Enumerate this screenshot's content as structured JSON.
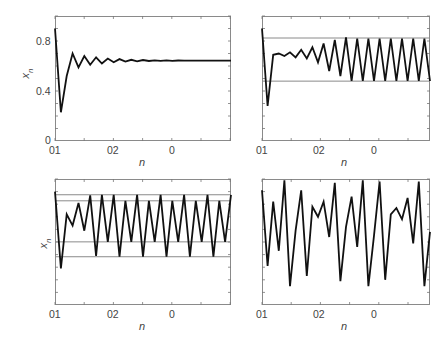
{
  "chart_data": [
    {
      "type": "line",
      "title": "",
      "panel": "top-left",
      "xlabel": "n",
      "ylabel": "x_n",
      "ylim": [
        0,
        1
      ],
      "yticks": [
        "0",
        "0.4",
        "0.8"
      ],
      "xticks": [
        "01",
        "02",
        "0"
      ],
      "grid": false,
      "reference_lines": [],
      "series": [
        {
          "name": "x_n",
          "values": [
            0.9,
            0.23,
            0.52,
            0.7,
            0.59,
            0.68,
            0.61,
            0.67,
            0.62,
            0.66,
            0.63,
            0.655,
            0.635,
            0.65,
            0.638,
            0.648,
            0.64,
            0.646,
            0.641,
            0.645,
            0.642,
            0.644,
            0.643,
            0.643,
            0.643,
            0.643,
            0.643,
            0.643,
            0.643,
            0.643,
            0.643
          ]
        }
      ]
    },
    {
      "type": "line",
      "title": "",
      "panel": "top-right",
      "xlabel": "n",
      "ylabel": "",
      "ylim": [
        0,
        1
      ],
      "xticks": [
        "01",
        "02",
        "0"
      ],
      "grid": false,
      "reference_lines": [
        0.824,
        0.479
      ],
      "series": [
        {
          "name": "x_n",
          "values": [
            0.9,
            0.28,
            0.69,
            0.7,
            0.68,
            0.71,
            0.67,
            0.73,
            0.66,
            0.75,
            0.63,
            0.78,
            0.56,
            0.81,
            0.52,
            0.83,
            0.48,
            0.82,
            0.48,
            0.82,
            0.48,
            0.82,
            0.48,
            0.82,
            0.48,
            0.82,
            0.48,
            0.82,
            0.48,
            0.82,
            0.48
          ]
        }
      ]
    },
    {
      "type": "line",
      "title": "",
      "panel": "bottom-left",
      "xlabel": "n",
      "ylabel": "x_n",
      "ylim": [
        0,
        1
      ],
      "xticks": [
        "01",
        "02",
        "0"
      ],
      "grid": false,
      "reference_lines": [
        0.875,
        0.827,
        0.501,
        0.383
      ],
      "series": [
        {
          "name": "x_n",
          "values": [
            0.9,
            0.29,
            0.72,
            0.63,
            0.81,
            0.59,
            0.87,
            0.39,
            0.875,
            0.501,
            0.875,
            0.383,
            0.827,
            0.501,
            0.875,
            0.383,
            0.827,
            0.501,
            0.875,
            0.383,
            0.827,
            0.501,
            0.875,
            0.383,
            0.827,
            0.501,
            0.875,
            0.383,
            0.827,
            0.501,
            0.875
          ]
        }
      ]
    },
    {
      "type": "line",
      "title": "",
      "panel": "bottom-right",
      "xlabel": "n",
      "ylabel": "",
      "ylim": [
        0,
        1
      ],
      "xticks": [
        "01",
        "02",
        "0"
      ],
      "grid": false,
      "reference_lines": [],
      "series": [
        {
          "name": "x_n",
          "values": [
            0.91,
            0.31,
            0.82,
            0.43,
            0.99,
            0.15,
            0.59,
            0.91,
            0.23,
            0.78,
            0.7,
            0.82,
            0.54,
            0.97,
            0.19,
            0.62,
            0.86,
            0.46,
            0.99,
            0.15,
            0.55,
            0.98,
            0.2,
            0.72,
            0.77,
            0.68,
            0.85,
            0.49,
            0.98,
            0.15,
            0.58
          ]
        }
      ]
    }
  ],
  "panels": {
    "top_left": {
      "xlabel": "n",
      "ylabel_main": "x",
      "ylabel_sub": "n",
      "yticks": [
        "0.8",
        "0.4",
        "0"
      ],
      "xticks": [
        "01",
        "02",
        "0"
      ]
    },
    "top_right": {
      "xlabel": "n",
      "xticks": [
        "01",
        "02",
        "0"
      ]
    },
    "bottom_left": {
      "xlabel": "n",
      "ylabel_main": "x",
      "ylabel_sub": "n",
      "xticks": [
        "01",
        "02",
        "0"
      ]
    },
    "bottom_right": {
      "xlabel": "n",
      "xticks": [
        "01",
        "02",
        "0"
      ]
    }
  }
}
